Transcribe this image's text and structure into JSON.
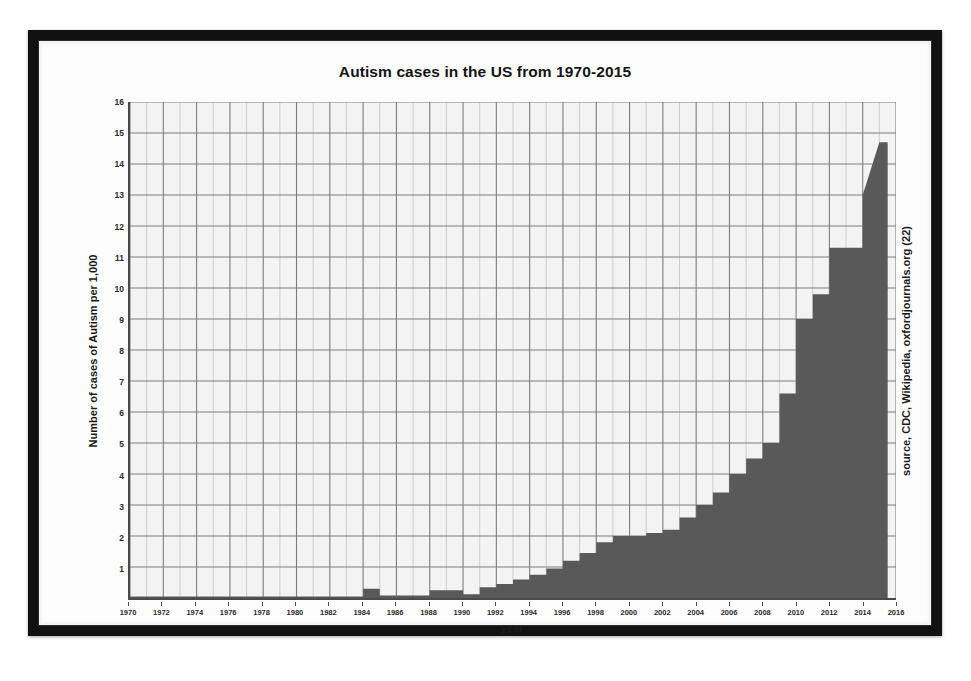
{
  "chart_data": {
    "type": "area",
    "title": "Autism cases in the US from 1970-2015",
    "xlabel": "year",
    "ylabel": "Number of cases of Autism per 1,000",
    "source_note": "source, CDC, Wikipedia, oxfordjournals.org (22)",
    "xlim": [
      1970,
      2016
    ],
    "ylim": [
      0,
      16
    ],
    "grid": true,
    "legend": "none",
    "series_color": "#595959",
    "plot_background": "#f3f3f3",
    "axis_color": "#4a4a4a",
    "frame_color": "#111111",
    "x_tick_labels": [
      "1970",
      "1972",
      "1974",
      "1976",
      "1978",
      "1980",
      "1982",
      "1984",
      "1986",
      "1988",
      "1990",
      "1992",
      "1994",
      "1996",
      "1998",
      "2000",
      "2002",
      "2004",
      "2006",
      "2008",
      "2010",
      "2012",
      "2014",
      "2016"
    ],
    "x_tick_values": [
      1970,
      1972,
      1974,
      1976,
      1978,
      1980,
      1982,
      1984,
      1986,
      1988,
      1990,
      1992,
      1994,
      1996,
      1998,
      2000,
      2002,
      2004,
      2006,
      2008,
      2010,
      2012,
      2014,
      2016
    ],
    "x_minor_step": 1,
    "y_tick_labels": [
      "0",
      "1",
      "2",
      "3",
      "4",
      "5",
      "6",
      "7",
      "8",
      "9",
      "10",
      "11",
      "12",
      "13",
      "14",
      "15",
      "16"
    ],
    "y_tick_values": [
      0,
      1,
      2,
      3,
      4,
      5,
      6,
      7,
      8,
      9,
      10,
      11,
      12,
      13,
      14,
      15,
      16
    ],
    "x": [
      1970,
      1971,
      1972,
      1973,
      1974,
      1975,
      1976,
      1977,
      1978,
      1979,
      1980,
      1981,
      1982,
      1983,
      1984,
      1985,
      1986,
      1987,
      1988,
      1989,
      1990,
      1991,
      1992,
      1993,
      1994,
      1995,
      1996,
      1997,
      1998,
      1999,
      2000,
      2001,
      2002,
      2003,
      2004,
      2005,
      2006,
      2007,
      2008,
      2009,
      2010,
      2011,
      2012,
      2013,
      2014,
      2015
    ],
    "values": [
      0.05,
      0.05,
      0.05,
      0.05,
      0.05,
      0.05,
      0.05,
      0.05,
      0.05,
      0.05,
      0.05,
      0.05,
      0.05,
      0.05,
      0.3,
      0.08,
      0.08,
      0.08,
      0.25,
      0.25,
      0.12,
      0.35,
      0.45,
      0.6,
      0.75,
      0.95,
      1.2,
      1.45,
      1.8,
      2.0,
      2.0,
      2.1,
      2.2,
      2.6,
      3.0,
      3.4,
      4.0,
      4.5,
      5.0,
      6.6,
      9.0,
      9.8,
      11.3,
      11.3,
      13.0,
      14.7
    ]
  },
  "figure": {
    "title": "Autism cases in the US from 1970-2015"
  }
}
